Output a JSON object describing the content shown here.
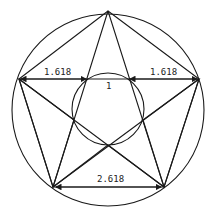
{
  "diagram": {
    "labels": {
      "left_segment": "1.618",
      "right_segment": "1.618",
      "center_segment": "1",
      "bottom_segment": "2.618"
    },
    "colors": {
      "line": "#1a1a1a",
      "background": "#ffffff"
    }
  }
}
